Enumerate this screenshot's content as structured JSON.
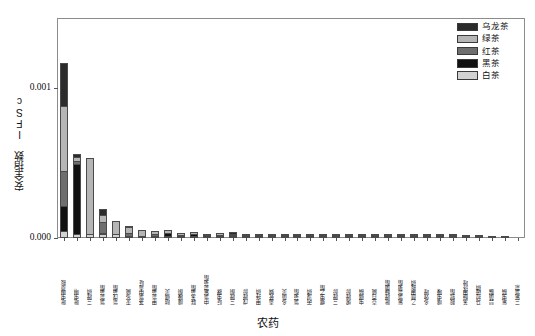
{
  "chart_data": {
    "type": "bar",
    "subtype": "stacked-bar",
    "title": "",
    "xlabel": "农药",
    "ylabel": "安全指数 IFSc",
    "ylim": [
      0.0,
      0.0014666
    ],
    "yticks": [
      0.0,
      0.001
    ],
    "ytick_labels": [
      "0.000",
      "0.001"
    ],
    "grid": false,
    "legend_position": "upper right",
    "series": [
      {
        "name": "乌龙茶",
        "color": "#2b2b2b",
        "values": [
          0.000287,
          2.2e-05,
          0.0,
          4e-05,
          0.0,
          8e-06,
          0.0,
          0.0,
          0.0,
          0.0,
          0.0,
          0.0,
          0.0,
          1.1e-05,
          0.0,
          0.0,
          0.0,
          0.0,
          0.0,
          0.0,
          0.0,
          0.0,
          0.0,
          0.0,
          0.0,
          0.0,
          0.0,
          0.0,
          0.0,
          0.0,
          0.0,
          0.0,
          0.0,
          0.0,
          0.0,
          0.0
        ]
      },
      {
        "name": "绿茶",
        "color": "#b5b5b5",
        "values": [
          0.000433,
          2.7e-05,
          0.000506,
          4.8e-05,
          8.9e-05,
          4e-05,
          4.3e-05,
          2e-05,
          1.9e-05,
          1.3e-05,
          1.4e-05,
          7e-06,
          1e-05,
          6e-06,
          8e-06,
          7e-06,
          6e-06,
          5e-06,
          5e-06,
          4e-06,
          4e-06,
          3e-06,
          3e-06,
          3e-06,
          2e-06,
          2e-06,
          2e-06,
          2e-06,
          1e-06,
          1e-06,
          1e-06,
          1e-06,
          1e-06,
          1e-06,
          0.0,
          0.0
        ]
      },
      {
        "name": "红茶",
        "color": "#6e6e6e",
        "values": [
          0.000233,
          1.6e-05,
          0.0,
          7.3e-05,
          0.0,
          2e-05,
          0.0,
          1.3e-05,
          0.0,
          9e-06,
          0.0,
          6e-06,
          0.0,
          5e-06,
          0.0,
          4e-06,
          0.0,
          3e-06,
          0.0,
          3e-06,
          0.0,
          2e-06,
          0.0,
          2e-06,
          0.0,
          2e-06,
          0.0,
          1e-06,
          0.0,
          1e-06,
          0.0,
          1e-06,
          0.0,
          0.0,
          0.0,
          0.0
        ]
      },
      {
        "name": "黑茶",
        "color": "#111111",
        "values": [
          0.000167,
          0.000469,
          0.0,
          7e-06,
          0.0,
          0.0,
          0.0,
          0.0,
          2.2e-05,
          0.0,
          1.3e-05,
          0.0,
          1e-05,
          0.0,
          7e-06,
          0.0,
          6e-06,
          0.0,
          5e-06,
          0.0,
          4e-06,
          0.0,
          3e-06,
          0.0,
          3e-06,
          0.0,
          2e-06,
          0.0,
          2e-06,
          0.0,
          1e-06,
          0.0,
          1e-06,
          0.0,
          1e-06,
          0.0
        ]
      },
      {
        "name": "白茶",
        "color": "#d2d2d2",
        "values": [
          4.7e-05,
          2.7e-05,
          2.7e-05,
          2.7e-05,
          2.7e-05,
          1.3e-05,
          7e-06,
          7e-06,
          7e-06,
          5e-06,
          5e-06,
          5e-06,
          4e-06,
          4e-06,
          3e-06,
          3e-06,
          3e-06,
          2e-06,
          2e-06,
          2e-06,
          2e-06,
          2e-06,
          1e-06,
          1e-06,
          1e-06,
          1e-06,
          1e-06,
          1e-06,
          1e-06,
          1e-06,
          1e-06,
          0.0,
          0.0,
          0.0,
          0.0,
          0.0
        ]
      }
    ],
    "categories": [
      "吡虫啉草胺",
      "吡虫啉",
      "三唑磷",
      "氯氰菊酯",
      "氰戊菊酯",
      "灭多威",
      "茶氯中毒啶",
      "甲氰菊酯",
      "哒螨灵",
      "噻嗪酮",
      "联苯菊酯",
      "中氯氟氰菊酯",
      "啶虫脒",
      "三唑酮",
      "戊唑醇",
      "甲拌磷",
      "毒死蜱",
      "多菌灵",
      "氯菊酯",
      "丙溴磷",
      "螺虫乙酯",
      "三唑醇",
      "烯唑醇",
      "虫螨腈",
      "克百威",
      "吡唑醚菌酯",
      "氟氯氰菊酯",
      "乙酰甲胺磷",
      "多效唑",
      "噻虫嗪",
      "胺鲜酯",
      "苯醚甲环唑",
      "马拉硫磷",
      "异菌脲",
      "氟虫腈",
      "三氟氯氰"
    ]
  },
  "axes": {
    "ytick_labels": [
      "0.000",
      "0.001"
    ],
    "ylabel": "安全指数 IFSc",
    "xlabel": "农药"
  },
  "legend": {
    "items": [
      {
        "label": "乌龙茶",
        "color": "#2b2b2b"
      },
      {
        "label": "绿茶",
        "color": "#b5b5b5"
      },
      {
        "label": "红茶",
        "color": "#6e6e6e"
      },
      {
        "label": "黑茶",
        "color": "#111111"
      },
      {
        "label": "白茶",
        "color": "#d2d2d2"
      }
    ]
  }
}
